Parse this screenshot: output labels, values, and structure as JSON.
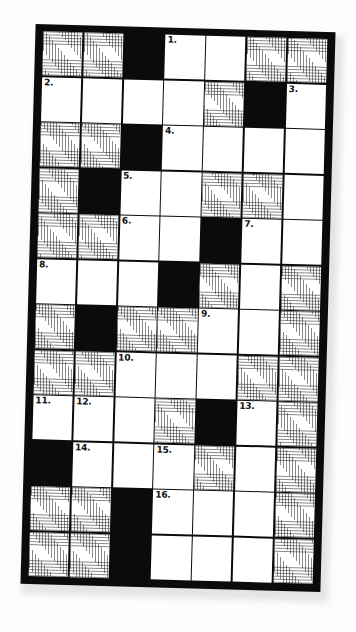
{
  "puzzle": {
    "type": "crossword-grid",
    "columns": 7,
    "rows": 12,
    "legend": {
      "white": "empty answer square",
      "hatch": "hatched / shaded square",
      "black": "blocked square"
    },
    "colors": {
      "ink": "#0b0b0b",
      "paper": "#ffffff",
      "hatch_line": "#282828",
      "page_background": "#fdfdfd"
    },
    "cells": [
      [
        {
          "t": "hatch",
          "n": ""
        },
        {
          "t": "hatch",
          "n": ""
        },
        {
          "t": "black",
          "n": ""
        },
        {
          "t": "white",
          "n": "1."
        },
        {
          "t": "white",
          "n": ""
        },
        {
          "t": "hatch",
          "n": ""
        },
        {
          "t": "hatch",
          "n": ""
        }
      ],
      [
        {
          "t": "white",
          "n": "2."
        },
        {
          "t": "white",
          "n": ""
        },
        {
          "t": "white",
          "n": ""
        },
        {
          "t": "white",
          "n": ""
        },
        {
          "t": "hatch",
          "n": ""
        },
        {
          "t": "black",
          "n": ""
        },
        {
          "t": "white",
          "n": "3."
        }
      ],
      [
        {
          "t": "hatch",
          "n": ""
        },
        {
          "t": "hatch",
          "n": ""
        },
        {
          "t": "black",
          "n": ""
        },
        {
          "t": "white",
          "n": "4."
        },
        {
          "t": "white",
          "n": ""
        },
        {
          "t": "white",
          "n": ""
        },
        {
          "t": "white",
          "n": ""
        }
      ],
      [
        {
          "t": "hatch",
          "n": ""
        },
        {
          "t": "black",
          "n": ""
        },
        {
          "t": "white",
          "n": "5."
        },
        {
          "t": "white",
          "n": ""
        },
        {
          "t": "hatch",
          "n": ""
        },
        {
          "t": "hatch",
          "n": ""
        },
        {
          "t": "white",
          "n": ""
        }
      ],
      [
        {
          "t": "hatch",
          "n": ""
        },
        {
          "t": "hatch",
          "n": ""
        },
        {
          "t": "white",
          "n": "6."
        },
        {
          "t": "white",
          "n": ""
        },
        {
          "t": "black",
          "n": ""
        },
        {
          "t": "white",
          "n": "7."
        },
        {
          "t": "white",
          "n": ""
        }
      ],
      [
        {
          "t": "white",
          "n": "8."
        },
        {
          "t": "white",
          "n": ""
        },
        {
          "t": "white",
          "n": ""
        },
        {
          "t": "black",
          "n": ""
        },
        {
          "t": "hatch",
          "n": ""
        },
        {
          "t": "white",
          "n": ""
        },
        {
          "t": "hatch",
          "n": ""
        }
      ],
      [
        {
          "t": "hatch",
          "n": ""
        },
        {
          "t": "black",
          "n": ""
        },
        {
          "t": "hatch",
          "n": ""
        },
        {
          "t": "hatch",
          "n": ""
        },
        {
          "t": "white",
          "n": "9."
        },
        {
          "t": "white",
          "n": ""
        },
        {
          "t": "hatch",
          "n": ""
        }
      ],
      [
        {
          "t": "hatch",
          "n": ""
        },
        {
          "t": "hatch",
          "n": ""
        },
        {
          "t": "white",
          "n": "10."
        },
        {
          "t": "white",
          "n": ""
        },
        {
          "t": "white",
          "n": ""
        },
        {
          "t": "hatch",
          "n": ""
        },
        {
          "t": "hatch",
          "n": ""
        }
      ],
      [
        {
          "t": "white",
          "n": "11."
        },
        {
          "t": "white",
          "n": "12."
        },
        {
          "t": "white",
          "n": ""
        },
        {
          "t": "hatch",
          "n": ""
        },
        {
          "t": "black",
          "n": ""
        },
        {
          "t": "white",
          "n": "13."
        },
        {
          "t": "hatch",
          "n": ""
        }
      ],
      [
        {
          "t": "black",
          "n": ""
        },
        {
          "t": "white",
          "n": "14."
        },
        {
          "t": "white",
          "n": ""
        },
        {
          "t": "white",
          "n": "15."
        },
        {
          "t": "hatch",
          "n": ""
        },
        {
          "t": "white",
          "n": ""
        },
        {
          "t": "hatch",
          "n": ""
        }
      ],
      [
        {
          "t": "hatch",
          "n": ""
        },
        {
          "t": "hatch",
          "n": ""
        },
        {
          "t": "black",
          "n": ""
        },
        {
          "t": "white",
          "n": "16."
        },
        {
          "t": "white",
          "n": ""
        },
        {
          "t": "white",
          "n": ""
        },
        {
          "t": "hatch",
          "n": ""
        }
      ],
      [
        {
          "t": "hatch",
          "n": ""
        },
        {
          "t": "hatch",
          "n": ""
        },
        {
          "t": "black",
          "n": ""
        },
        {
          "t": "white",
          "n": ""
        },
        {
          "t": "white",
          "n": ""
        },
        {
          "t": "white",
          "n": ""
        },
        {
          "t": "hatch",
          "n": ""
        }
      ]
    ],
    "clue_numbers": [
      "1.",
      "2.",
      "3.",
      "4.",
      "5.",
      "6.",
      "7.",
      "8.",
      "9.",
      "10.",
      "11.",
      "12.",
      "13.",
      "14.",
      "15.",
      "16."
    ]
  }
}
